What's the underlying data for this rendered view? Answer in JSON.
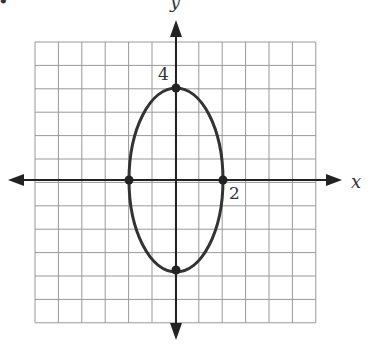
{
  "chart_data": {
    "type": "line",
    "title": "",
    "xlabel": "x",
    "ylabel": "y",
    "grid": true,
    "xlim": [
      -6,
      6
    ],
    "ylim": [
      -6,
      6
    ],
    "curve": {
      "shape": "ellipse",
      "center": [
        0,
        0
      ],
      "semi_x": 2,
      "semi_y": 4
    },
    "points": [
      {
        "x": 0,
        "y": 4
      },
      {
        "x": 0,
        "y": -4
      },
      {
        "x": -2,
        "y": 0
      },
      {
        "x": 2,
        "y": 0
      }
    ],
    "annotations": [
      {
        "text": "4",
        "at": [
          0,
          4
        ]
      },
      {
        "text": "2",
        "at": [
          2,
          0
        ]
      }
    ]
  },
  "labels": {
    "bullet": "•",
    "x_axis": "x",
    "y_axis": "y",
    "tick_y": "4",
    "tick_x": "2"
  }
}
